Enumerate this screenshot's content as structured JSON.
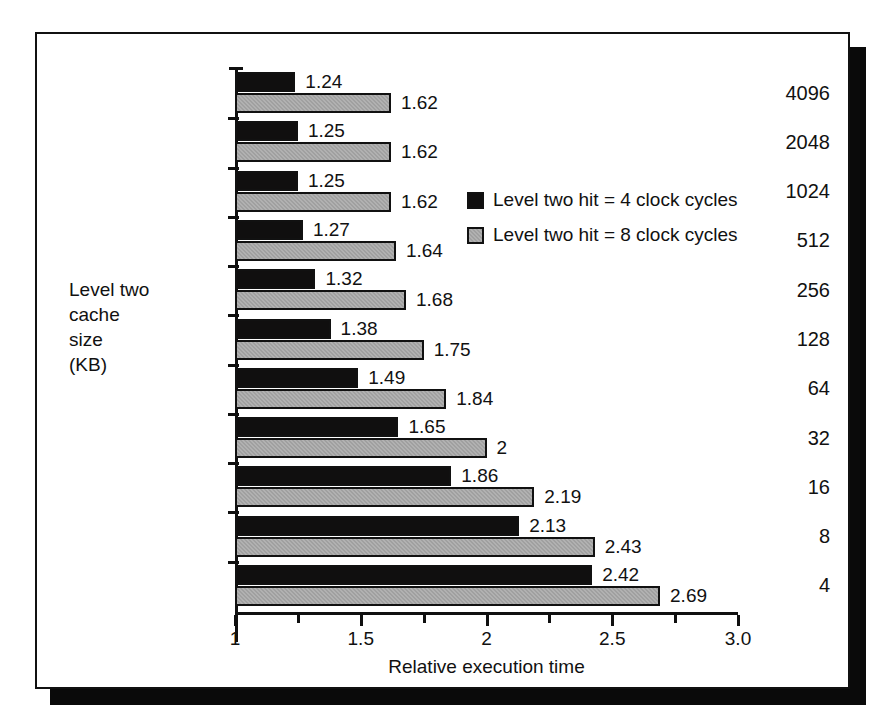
{
  "chart_data": {
    "type": "bar",
    "orientation": "horizontal",
    "title": "",
    "xlabel": "Relative execution time",
    "ylabel": "Level two cache size (KB)",
    "ylabel_lines": "Level two\ncache\nsize\n(KB)",
    "categories": [
      "4096",
      "2048",
      "1024",
      "512",
      "256",
      "128",
      "64",
      "32",
      "16",
      "8",
      "4"
    ],
    "series": [
      {
        "name": "Level two hit = 4 clock cycles",
        "color": "#100f0f",
        "values": [
          1.24,
          1.25,
          1.25,
          1.27,
          1.32,
          1.38,
          1.49,
          1.65,
          1.86,
          2.13,
          2.42
        ],
        "labels": [
          "1.24",
          "1.25",
          "1.25",
          "1.27",
          "1.32",
          "1.38",
          "1.49",
          "1.65",
          "1.86",
          "2.13",
          "2.42"
        ]
      },
      {
        "name": "Level two hit = 8 clock cycles",
        "color": "#a0a0a0",
        "values": [
          1.62,
          1.62,
          1.62,
          1.64,
          1.68,
          1.75,
          1.84,
          2.0,
          2.19,
          2.43,
          2.69
        ],
        "labels": [
          "1.62",
          "1.62",
          "1.62",
          "1.64",
          "1.68",
          "1.75",
          "1.84",
          "2",
          "2.19",
          "2.43",
          "2.69"
        ]
      }
    ],
    "xlim": [
      1,
      3
    ],
    "xticks": [
      1,
      1.5,
      2,
      2.5,
      3
    ],
    "xtick_labels": [
      "1",
      "1.5",
      "2",
      "2.5",
      "3.0"
    ],
    "xminor_ticks": [
      1.25,
      1.75,
      2.25,
      2.75
    ],
    "grid": false,
    "legend_position": "upper right inside"
  },
  "legend": {
    "entries": [
      {
        "label": "Level two hit = 4 clock cycles",
        "swatch": "black-square"
      },
      {
        "label": "Level two hit = 8 clock cycles",
        "swatch": "gray-square"
      }
    ]
  }
}
